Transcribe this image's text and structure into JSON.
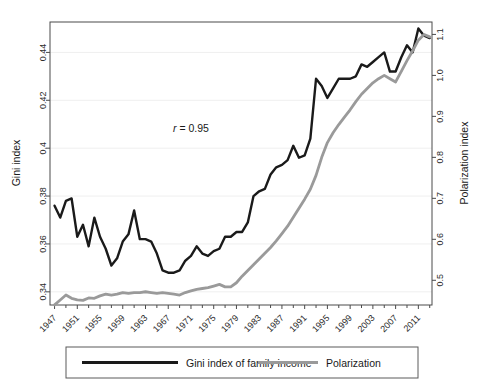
{
  "figure": {
    "annotation": {
      "prefix": "r",
      "suffix": " = 0.95",
      "full": "r = 0.95"
    }
  },
  "chart_data": {
    "type": "line",
    "title": "",
    "xlabel": "",
    "ylabel": "Gini index",
    "y2label": "Polarization index",
    "grid": true,
    "legend_position": "bottom",
    "annotations": [
      {
        "text": "r = 0.95",
        "x": 1971,
        "y_axis": "left",
        "y": 0.408
      }
    ],
    "x": [
      1947,
      1948,
      1949,
      1950,
      1951,
      1952,
      1953,
      1954,
      1955,
      1956,
      1957,
      1958,
      1959,
      1960,
      1961,
      1962,
      1963,
      1964,
      1965,
      1966,
      1967,
      1968,
      1969,
      1970,
      1971,
      1972,
      1973,
      1974,
      1975,
      1976,
      1977,
      1978,
      1979,
      1980,
      1981,
      1982,
      1983,
      1984,
      1985,
      1986,
      1987,
      1988,
      1989,
      1990,
      1991,
      1992,
      1993,
      1994,
      1995,
      1996,
      1997,
      1998,
      1999,
      2000,
      2001,
      2002,
      2003,
      2004,
      2005,
      2006,
      2007,
      2008,
      2009,
      2010,
      2011,
      2012,
      2013
    ],
    "xticks": [
      1947,
      1951,
      1955,
      1959,
      1963,
      1967,
      1971,
      1975,
      1979,
      1983,
      1987,
      1991,
      1995,
      1999,
      2003,
      2007,
      2011
    ],
    "xlim": [
      1946.2,
      2013.4
    ],
    "yticks": [
      0.34,
      0.36,
      0.38,
      0.4,
      0.42,
      0.44
    ],
    "ytick_labels": [
      "0.34",
      "0.36",
      "0.38",
      "0.4",
      "0.42",
      "0.44"
    ],
    "ylim": [
      0.3345,
      0.4527
    ],
    "y2ticks": [
      0.5,
      0.6,
      0.7,
      0.8,
      0.9,
      1.0,
      1.1
    ],
    "y2tick_labels": [
      "0.5",
      "0.6",
      "0.7",
      "0.8",
      "0.9",
      "1.0",
      "1.1"
    ],
    "y2lim": [
      0.4397,
      1.1303
    ],
    "series": [
      {
        "name": "Gini index of family income",
        "axis": "left",
        "color": "#1a1a1a",
        "width": 2.4,
        "values": [
          0.376,
          0.371,
          0.378,
          0.379,
          0.363,
          0.368,
          0.359,
          0.371,
          0.363,
          0.358,
          0.351,
          0.354,
          0.361,
          0.364,
          0.374,
          0.362,
          0.362,
          0.361,
          0.356,
          0.349,
          0.348,
          0.348,
          0.349,
          0.353,
          0.355,
          0.359,
          0.356,
          0.355,
          0.357,
          0.358,
          0.363,
          0.363,
          0.365,
          0.365,
          0.369,
          0.38,
          0.382,
          0.383,
          0.389,
          0.392,
          0.393,
          0.395,
          0.401,
          0.396,
          0.397,
          0.404,
          0.429,
          0.426,
          0.421,
          0.425,
          0.429,
          0.429,
          0.429,
          0.43,
          0.435,
          0.434,
          0.436,
          0.438,
          0.44,
          0.432,
          0.432,
          0.438,
          0.443,
          0.44,
          0.45,
          0.447,
          0.446
        ]
      },
      {
        "name": "Polarization",
        "axis": "right",
        "color": "#9a9a9a",
        "width": 2.8,
        "values": [
          0.44,
          0.452,
          0.464,
          0.456,
          0.452,
          0.451,
          0.457,
          0.456,
          0.462,
          0.466,
          0.464,
          0.466,
          0.47,
          0.468,
          0.47,
          0.47,
          0.472,
          0.47,
          0.468,
          0.47,
          0.468,
          0.466,
          0.464,
          0.47,
          0.474,
          0.478,
          0.48,
          0.482,
          0.486,
          0.49,
          0.484,
          0.484,
          0.494,
          0.51,
          0.524,
          0.538,
          0.552,
          0.566,
          0.58,
          0.596,
          0.614,
          0.632,
          0.654,
          0.676,
          0.698,
          0.722,
          0.756,
          0.8,
          0.836,
          0.86,
          0.88,
          0.898,
          0.916,
          0.936,
          0.954,
          0.968,
          0.982,
          0.992,
          1.0,
          0.992,
          0.984,
          1.01,
          1.036,
          1.06,
          1.086,
          1.1,
          1.094
        ]
      }
    ]
  },
  "legend": {
    "items": [
      {
        "label": "Gini index of family income",
        "color": "#1a1a1a",
        "width": 3.2
      },
      {
        "label": "Polarization",
        "color": "#9a9a9a",
        "width": 3.0
      }
    ]
  }
}
